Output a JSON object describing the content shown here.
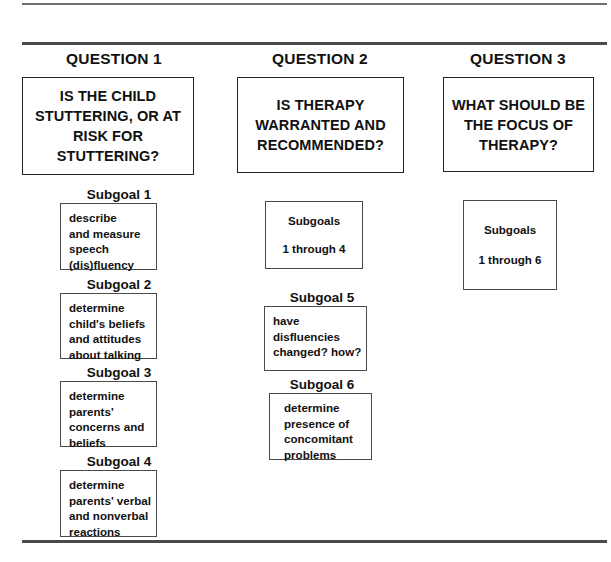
{
  "rules": {
    "top": "horizontal-rule",
    "header": "horizontal-rule",
    "bottom": "horizontal-rule"
  },
  "columns": [
    {
      "title": "QUESTION 1",
      "question": {
        "lines": [
          "IS THE CHILD",
          "STUTTERING, OR",
          "AT RISK FOR",
          "STUTTERING?"
        ]
      },
      "subgoals": [
        {
          "label": "Subgoal 1",
          "lines": [
            "describe",
            "and measure",
            "speech",
            "(dis)fluency"
          ]
        },
        {
          "label": "Subgoal 2",
          "lines": [
            "determine",
            "child's beliefs",
            "and attitudes",
            "about talking"
          ]
        },
        {
          "label": "Subgoal 3",
          "lines": [
            "determine",
            "parents'",
            "concerns and",
            "beliefs"
          ]
        },
        {
          "label": "Subgoal 4",
          "lines": [
            "determine",
            "parents' verbal",
            "and nonverbal",
            "reactions"
          ]
        }
      ]
    },
    {
      "title": "QUESTION 2",
      "question": {
        "lines": [
          "IS THERAPY",
          "WARRANTED",
          "AND",
          "RECOMMENDED?"
        ]
      },
      "group_box": {
        "line1": "Subgoals",
        "line2": "1 through 4"
      },
      "subgoals": [
        {
          "label": "Subgoal 5",
          "lines": [
            "have",
            "disfluencies",
            "changed?  how?"
          ]
        },
        {
          "label": "Subgoal 6",
          "lines": [
            "determine",
            "presence of",
            "concomitant",
            "problems"
          ]
        }
      ]
    },
    {
      "title": "QUESTION 3",
      "question": {
        "lines": [
          "WHAT SHOULD",
          "BE THE FOCUS",
          "OF THERAPY?"
        ]
      },
      "group_box": {
        "line1": "Subgoals",
        "line2": "1 through 6"
      }
    }
  ],
  "colors": {
    "ink": "#111111",
    "rule": "#4a4a4a",
    "box_border": "#222222",
    "detail_border": "#4a4a4a",
    "background": "#ffffff"
  }
}
